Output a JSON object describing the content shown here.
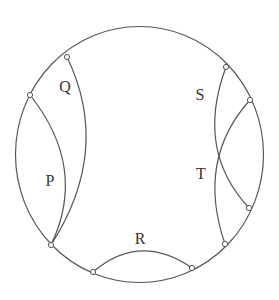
{
  "diagram": {
    "type": "circle-with-arcs",
    "line_color": "#555555",
    "labels": {
      "P": "P",
      "Q": "Q",
      "R": "R",
      "S": "S",
      "T": "T"
    },
    "regions": [
      {
        "label": "Q",
        "description": "region between outer circle and left arc from top-left point to bottom-left point"
      },
      {
        "label": "P",
        "description": "lens region between two left arcs"
      },
      {
        "label": "R",
        "description": "lens region at bottom between arc and outer circle"
      },
      {
        "label": "S",
        "description": "upper region formed by crossing right arcs"
      },
      {
        "label": "T",
        "description": "lower region formed by crossing right arcs"
      }
    ],
    "points_count": 9
  }
}
